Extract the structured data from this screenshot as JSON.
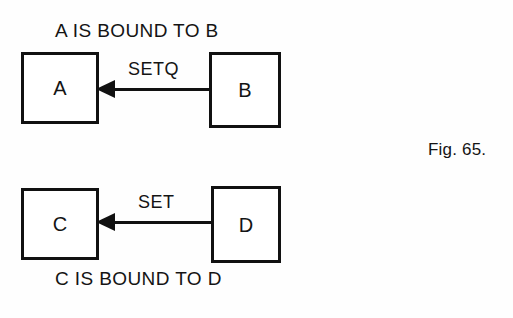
{
  "figure": {
    "caption": "Fig. 65.",
    "background_color": "#fefefe",
    "ink_color": "#111111"
  },
  "diagrams": [
    {
      "id": "upper",
      "title": "A IS BOUND TO B",
      "title_position": "above",
      "source_node": "B",
      "target_node": "A",
      "edge_label": "SETQ",
      "arrow_direction": "right-to-left"
    },
    {
      "id": "lower",
      "title": "C IS BOUND TO D",
      "title_position": "below",
      "source_node": "D",
      "target_node": "C",
      "edge_label": "SET",
      "arrow_direction": "right-to-left"
    }
  ],
  "nodes": {
    "a": "A",
    "b": "B",
    "c": "C",
    "d": "D"
  }
}
